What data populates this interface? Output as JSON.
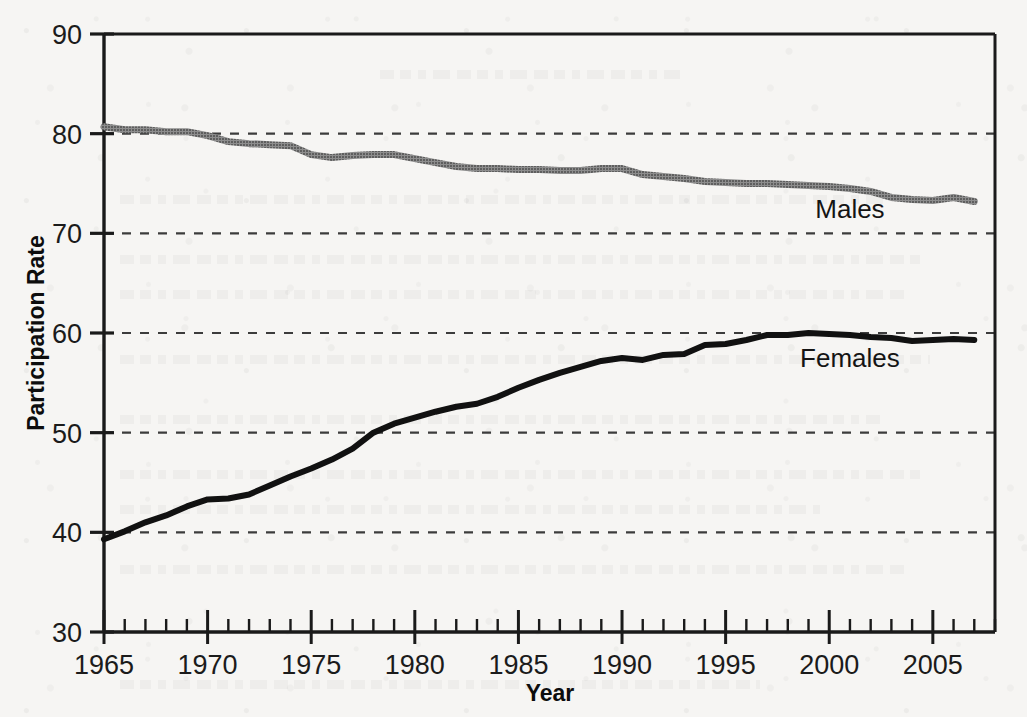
{
  "chart_data": {
    "type": "line",
    "title": "",
    "subtitle": "",
    "xlabel": "Year",
    "ylabel": "Participation Rate",
    "xlim": [
      1965,
      2008
    ],
    "ylim": [
      30,
      90
    ],
    "x_tick_labels": [
      "1965",
      "1970",
      "1975",
      "1980",
      "1985",
      "1990",
      "1995",
      "2000",
      "2005"
    ],
    "x_ticks": [
      1965,
      1970,
      1975,
      1980,
      1985,
      1990,
      1995,
      2000,
      2005
    ],
    "x_minor_tick_interval": 1,
    "y_tick_labels": [
      "30",
      "40",
      "50",
      "60",
      "70",
      "80",
      "90"
    ],
    "y_ticks": [
      30,
      40,
      50,
      60,
      70,
      80,
      90
    ],
    "grid": true,
    "grid_axis": "y",
    "grid_style": "dashed",
    "grid_values": [
      40,
      50,
      60,
      70,
      80
    ],
    "legend_position": "inline-annotation",
    "x": [
      1965,
      1966,
      1967,
      1968,
      1969,
      1970,
      1971,
      1972,
      1973,
      1974,
      1975,
      1976,
      1977,
      1978,
      1979,
      1980,
      1981,
      1982,
      1983,
      1984,
      1985,
      1986,
      1987,
      1988,
      1989,
      1990,
      1991,
      1992,
      1993,
      1994,
      1995,
      1996,
      1997,
      1998,
      1999,
      2000,
      2001,
      2002,
      2003,
      2004,
      2005,
      2006,
      2007
    ],
    "series": [
      {
        "name": "Males",
        "color": "#7a7a7a",
        "style": "solid-halftone",
        "values": [
          80.7,
          80.4,
          80.4,
          80.2,
          80.2,
          79.8,
          79.2,
          79.0,
          78.9,
          78.8,
          77.9,
          77.6,
          77.8,
          77.9,
          77.9,
          77.5,
          77.1,
          76.7,
          76.5,
          76.5,
          76.4,
          76.4,
          76.3,
          76.3,
          76.5,
          76.5,
          75.9,
          75.7,
          75.5,
          75.2,
          75.1,
          75.0,
          75.0,
          74.9,
          74.8,
          74.7,
          74.5,
          74.2,
          73.6,
          73.4,
          73.3,
          73.6,
          73.2
        ]
      },
      {
        "name": "Females",
        "color": "#111111",
        "style": "solid",
        "values": [
          39.3,
          40.1,
          41.0,
          41.7,
          42.6,
          43.3,
          43.4,
          43.8,
          44.7,
          45.6,
          46.4,
          47.3,
          48.4,
          50.0,
          50.9,
          51.5,
          52.1,
          52.6,
          52.9,
          53.6,
          54.5,
          55.3,
          56.0,
          56.6,
          57.2,
          57.5,
          57.3,
          57.8,
          57.9,
          58.8,
          58.9,
          59.3,
          59.8,
          59.8,
          60.0,
          59.9,
          59.8,
          59.6,
          59.5,
          59.2,
          59.3,
          59.4,
          59.3
        ]
      }
    ],
    "annotations": [
      {
        "text": "Males",
        "x": 2001.0,
        "y": 71.5
      },
      {
        "text": "Females",
        "x": 2001.0,
        "y": 56.6
      }
    ]
  },
  "axes": {
    "ylabel": "Participation Rate",
    "xlabel": "Year"
  }
}
